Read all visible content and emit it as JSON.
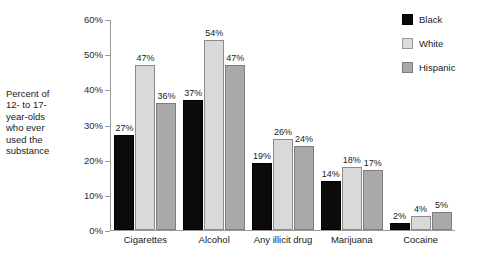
{
  "chart_data": {
    "type": "bar",
    "title": "",
    "subtitle": "",
    "xlabel": "",
    "ylabel": "Percent of\n12- to 17-\nyear-olds\nwho ever\nused the\nsubstance",
    "ylim": [
      0,
      60
    ],
    "grid": false,
    "legend_position": "right",
    "y_ticks": [
      "0%",
      "10%",
      "20%",
      "30%",
      "40%",
      "50%",
      "60%"
    ],
    "y_tick_values": [
      0,
      10,
      20,
      30,
      40,
      50,
      60
    ],
    "categories": [
      "Cigarettes",
      "Alcohol",
      "Any illicit drug",
      "Marijuana",
      "Cocaine"
    ],
    "series": [
      {
        "name": "Black",
        "color": "#0b0b0b",
        "values": [
          27,
          37,
          19,
          14,
          2
        ],
        "labels": [
          "27%",
          "37%",
          "19%",
          "14%",
          "2%"
        ]
      },
      {
        "name": "White",
        "color": "#d9d9d9",
        "values": [
          47,
          54,
          26,
          18,
          4
        ],
        "labels": [
          "47%",
          "54%",
          "26%",
          "18%",
          "4%"
        ]
      },
      {
        "name": "Hispanic",
        "color": "#a9a9a9",
        "values": [
          36,
          47,
          24,
          17,
          5
        ],
        "labels": [
          "36%",
          "47%",
          "24%",
          "17%",
          "5%"
        ]
      }
    ]
  },
  "legend": {
    "items": [
      {
        "label": "Black",
        "swatch": "black"
      },
      {
        "label": "White",
        "swatch": "white"
      },
      {
        "label": "Hispanic",
        "swatch": "hispanic"
      }
    ]
  }
}
